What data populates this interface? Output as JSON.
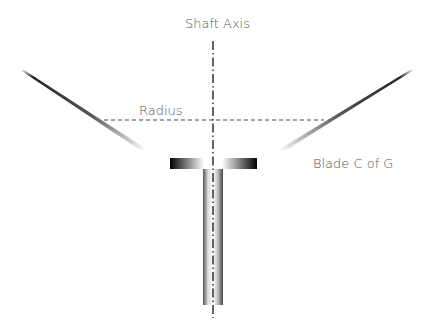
{
  "diagram": {
    "labels": {
      "shaft_axis": "Shaft Axis",
      "radius": "Radius",
      "blade_cog": "Blade C of G"
    },
    "colors": {
      "text": "#555555",
      "line": "#333333",
      "dark": "#111111",
      "light": "#ffffff"
    }
  }
}
